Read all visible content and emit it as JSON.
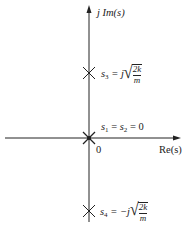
{
  "diagram": {
    "type": "pole-zero plot (s-plane)",
    "axes": {
      "imaginary_label": "j Im(s)",
      "real_label": "Re(s)",
      "origin_label": "0"
    },
    "poles": [
      {
        "id": "s3",
        "label_var": "s",
        "label_sub": "3",
        "label_eq": "= j",
        "sqrt_num": "2k",
        "sqrt_den": "m",
        "position": "upper imaginary axis"
      },
      {
        "id": "s1s2",
        "label": "s1 = s2 = 0",
        "label_parts": {
          "v1": "s",
          "sub1": "1",
          "mid": " = ",
          "v2": "s",
          "sub2": "2",
          "end": " = 0"
        },
        "position": "origin (double pole)"
      },
      {
        "id": "s4",
        "label_var": "s",
        "label_sub": "4",
        "label_eq": "= −j",
        "sqrt_num": "2k",
        "sqrt_den": "m",
        "position": "lower imaginary axis"
      }
    ],
    "colors": {
      "ink": "#222222",
      "background": "#ffffff"
    }
  }
}
